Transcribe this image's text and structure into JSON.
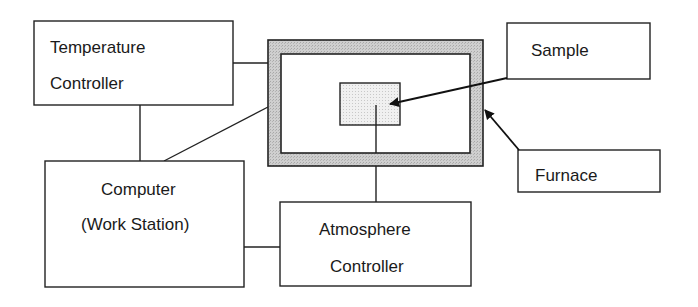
{
  "diagram": {
    "type": "block-diagram",
    "nodes": {
      "temperature_controller": {
        "line1": "Temperature",
        "line2": "Controller"
      },
      "computer": {
        "line1": "Computer",
        "line2": "(Work Station)"
      },
      "atmosphere_controller": {
        "line1": "Atmosphere",
        "line2": "Controller"
      },
      "sample_label": {
        "text": "Sample"
      },
      "furnace_label": {
        "text": "Furnace"
      }
    },
    "edges": [
      {
        "from": "temperature_controller",
        "to": "furnace",
        "kind": "line"
      },
      {
        "from": "temperature_controller",
        "to": "computer",
        "kind": "line"
      },
      {
        "from": "computer",
        "to": "furnace",
        "kind": "line"
      },
      {
        "from": "computer",
        "to": "atmosphere_controller",
        "kind": "line"
      },
      {
        "from": "atmosphere_controller",
        "to": "sample",
        "kind": "line"
      },
      {
        "from": "sample_label",
        "to": "sample",
        "kind": "arrow"
      },
      {
        "from": "furnace_label",
        "to": "furnace",
        "kind": "arrow"
      }
    ],
    "colors": {
      "stroke": "#222222",
      "furnace_wall": "#c8c8c8",
      "sample_fill": "#ececec"
    }
  }
}
